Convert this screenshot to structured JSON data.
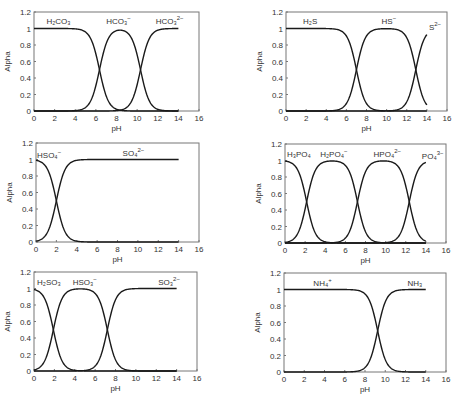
{
  "chart_data": [
    {
      "id": "carbonate",
      "type": "line",
      "title": "",
      "xlabel": "pH",
      "ylabel": "Alpha",
      "xlim": [
        0,
        16
      ],
      "ylim": [
        0,
        1.2
      ],
      "xticks": [
        "0",
        "2",
        "4",
        "6",
        "8",
        "10",
        "12",
        "14",
        "16"
      ],
      "yticks": [
        "0",
        "0.2",
        "0.4",
        "0.6",
        "0.8",
        "1",
        "1.2"
      ],
      "grid": false,
      "pKa": [
        6.35,
        10.33
      ],
      "x_range": [
        0,
        14
      ],
      "series": [
        {
          "name": "H2CO3",
          "label": "H₂CO₃",
          "x": [
            0,
            2,
            4,
            5,
            6,
            6.35,
            7,
            8,
            9,
            10,
            10.33,
            11,
            12,
            14
          ],
          "values": [
            1.0,
            1.0,
            0.996,
            0.957,
            0.69,
            0.5,
            0.183,
            0.022,
            0.002,
            0.0,
            0.0,
            0.0,
            0.0,
            0.0
          ]
        },
        {
          "name": "HCO3-",
          "label": "HCO₃⁻",
          "x": [
            0,
            2,
            4,
            5,
            6,
            6.35,
            7,
            8,
            8.34,
            9,
            10,
            10.33,
            11,
            12,
            14
          ],
          "values": [
            0.0,
            0.0,
            0.004,
            0.043,
            0.309,
            0.5,
            0.816,
            0.956,
            0.98,
            0.954,
            0.68,
            0.5,
            0.176,
            0.021,
            0.0
          ]
        },
        {
          "name": "CO3 2-",
          "label": "CO₃²⁻",
          "x": [
            0,
            6,
            8,
            9,
            10,
            10.33,
            11,
            12,
            13,
            14
          ],
          "values": [
            0.0,
            0.0,
            0.005,
            0.044,
            0.319,
            0.5,
            0.824,
            0.979,
            0.998,
            1.0
          ]
        }
      ]
    },
    {
      "id": "sulfide",
      "type": "line",
      "title": "",
      "xlabel": "pH",
      "ylabel": "Alpha",
      "xlim": [
        0,
        16
      ],
      "ylim": [
        0,
        1.2
      ],
      "xticks": [
        "0",
        "2",
        "4",
        "6",
        "8",
        "10",
        "12",
        "14",
        "16"
      ],
      "yticks": [
        "0",
        "0.2",
        "0.4",
        "0.6",
        "0.8",
        "1",
        "1.2"
      ],
      "grid": false,
      "pKa": [
        7.0,
        12.9
      ],
      "x_range": [
        0,
        14
      ],
      "series": [
        {
          "name": "H2S",
          "label": "H₂S",
          "x": [
            0,
            2,
            4,
            5,
            6,
            7,
            8,
            9,
            10,
            14
          ],
          "values": [
            1.0,
            1.0,
            0.999,
            0.99,
            0.909,
            0.5,
            0.091,
            0.01,
            0.001,
            0.0
          ]
        },
        {
          "name": "HS-",
          "label": "HS⁻",
          "x": [
            0,
            4,
            5,
            6,
            7,
            8,
            9,
            10,
            11,
            12,
            12.9,
            13,
            14
          ],
          "values": [
            0.0,
            0.001,
            0.01,
            0.091,
            0.5,
            0.909,
            0.99,
            0.998,
            0.987,
            0.888,
            0.5,
            0.443,
            0.074
          ]
        },
        {
          "name": "S2-",
          "label": "S²⁻",
          "x": [
            0,
            10,
            11,
            12,
            12.9,
            13,
            14
          ],
          "values": [
            0.0,
            0.001,
            0.012,
            0.112,
            0.5,
            0.557,
            0.926
          ]
        }
      ]
    },
    {
      "id": "sulfate",
      "type": "line",
      "title": "",
      "xlabel": "pH",
      "ylabel": "Alpha",
      "xlim": [
        0,
        16
      ],
      "ylim": [
        0,
        1.2
      ],
      "xticks": [
        "0",
        "2",
        "4",
        "6",
        "8",
        "10",
        "12",
        "14",
        "16"
      ],
      "yticks": [
        "0",
        "0.2",
        "0.4",
        "0.6",
        "0.8",
        "1",
        "1.2"
      ],
      "grid": false,
      "pKa": [
        2.0
      ],
      "x_range": [
        0,
        14
      ],
      "series": [
        {
          "name": "HSO4-",
          "label": "HSO₄⁻",
          "x": [
            0,
            1,
            2,
            3,
            4,
            5,
            14
          ],
          "values": [
            0.99,
            0.909,
            0.5,
            0.091,
            0.01,
            0.001,
            0.0
          ]
        },
        {
          "name": "SO4 2-",
          "label": "SO₄²⁻",
          "x": [
            0,
            1,
            2,
            3,
            4,
            5,
            14
          ],
          "values": [
            0.01,
            0.091,
            0.5,
            0.909,
            0.99,
            0.999,
            1.0
          ]
        }
      ]
    },
    {
      "id": "phosphate",
      "type": "line",
      "title": "",
      "xlabel": "pH",
      "ylabel": "Alpha",
      "xlim": [
        0,
        16
      ],
      "ylim": [
        0,
        1.2
      ],
      "xticks": [
        "0",
        "2",
        "4",
        "6",
        "8",
        "10",
        "12",
        "14",
        "16"
      ],
      "yticks": [
        "0",
        "0.2",
        "0.4",
        "0.6",
        "0.8",
        "1",
        "1.2"
      ],
      "grid": false,
      "pKa": [
        2.15,
        7.2,
        12.35
      ],
      "x_range": [
        0,
        14
      ],
      "series": [
        {
          "name": "H3PO4",
          "label": "H₃PO₄",
          "x": [
            0,
            1,
            2,
            2.15,
            3,
            4,
            5,
            14
          ],
          "values": [
            0.993,
            0.934,
            0.585,
            0.5,
            0.124,
            0.014,
            0.001,
            0.0
          ]
        },
        {
          "name": "H2PO4-",
          "label": "H₂PO₄⁻",
          "x": [
            0,
            1,
            2,
            2.15,
            3,
            4,
            4.7,
            5,
            6,
            7,
            7.2,
            8,
            9,
            10,
            14
          ],
          "values": [
            0.007,
            0.066,
            0.415,
            0.5,
            0.876,
            0.983,
            0.994,
            0.993,
            0.94,
            0.613,
            0.5,
            0.137,
            0.016,
            0.002,
            0.0
          ]
        },
        {
          "name": "HPO4 2-",
          "label": "HPO₄²⁻",
          "x": [
            0,
            5,
            6,
            7,
            7.2,
            8,
            9,
            9.8,
            10,
            11,
            12,
            12.35,
            13,
            14
          ],
          "values": [
            0.0,
            0.006,
            0.059,
            0.387,
            0.5,
            0.863,
            0.984,
            0.995,
            0.993,
            0.957,
            0.691,
            0.5,
            0.183,
            0.022
          ]
        },
        {
          "name": "PO4 3-",
          "label": "PO₄³⁻",
          "x": [
            0,
            9,
            10,
            11,
            12,
            12.35,
            13,
            14
          ],
          "values": [
            0.0,
            0.0,
            0.004,
            0.043,
            0.309,
            0.5,
            0.817,
            0.978
          ]
        }
      ]
    },
    {
      "id": "sulfite",
      "type": "line",
      "title": "",
      "xlabel": "pH",
      "ylabel": "Alpha",
      "xlim": [
        0,
        16
      ],
      "ylim": [
        0,
        1.2
      ],
      "xticks": [
        "0",
        "2",
        "4",
        "6",
        "8",
        "10",
        "12",
        "14",
        "16"
      ],
      "yticks": [
        "0",
        "0.2",
        "0.4",
        "0.6",
        "0.8",
        "1",
        "1.2"
      ],
      "grid": false,
      "pKa": [
        1.9,
        7.2
      ],
      "x_range": [
        0,
        14
      ],
      "series": [
        {
          "name": "H2SO3",
          "label": "H₂SO₃",
          "x": [
            0,
            1,
            1.9,
            3,
            4,
            5,
            14
          ],
          "values": [
            0.988,
            0.888,
            0.5,
            0.074,
            0.008,
            0.001,
            0.0
          ]
        },
        {
          "name": "HSO3-",
          "label": "HSO₃⁻",
          "x": [
            0,
            1,
            1.9,
            3,
            4,
            4.55,
            5,
            6,
            7,
            7.2,
            8,
            9,
            10,
            14
          ],
          "values": [
            0.012,
            0.112,
            0.5,
            0.926,
            0.991,
            0.995,
            0.993,
            0.94,
            0.613,
            0.5,
            0.137,
            0.016,
            0.002,
            0.0
          ]
        },
        {
          "name": "SO3 2-",
          "label": "SO₃²⁻",
          "x": [
            0,
            5,
            6,
            7,
            7.2,
            8,
            9,
            10,
            14
          ],
          "values": [
            0.0,
            0.006,
            0.059,
            0.387,
            0.5,
            0.863,
            0.984,
            0.998,
            1.0
          ]
        }
      ]
    },
    {
      "id": "ammonium",
      "type": "line",
      "title": "",
      "xlabel": "pH",
      "ylabel": "Alpha",
      "xlim": [
        0,
        16
      ],
      "ylim": [
        0,
        1.2
      ],
      "xticks": [
        "0",
        "2",
        "4",
        "6",
        "8",
        "10",
        "12",
        "14",
        "16"
      ],
      "yticks": [
        "0",
        "0.2",
        "0.4",
        "0.6",
        "0.8",
        "1",
        "1.2"
      ],
      "grid": false,
      "pKa": [
        9.25
      ],
      "x_range": [
        0,
        14
      ],
      "series": [
        {
          "name": "NH4+",
          "label": "NH₄⁺",
          "x": [
            0,
            6,
            7,
            8,
            9,
            9.25,
            10,
            11,
            12,
            14
          ],
          "values": [
            1.0,
            0.999,
            0.994,
            0.947,
            0.64,
            0.5,
            0.151,
            0.017,
            0.002,
            0.0
          ]
        },
        {
          "name": "NH3",
          "label": "NH₃",
          "x": [
            0,
            6,
            7,
            8,
            9,
            9.25,
            10,
            11,
            12,
            14
          ],
          "values": [
            0.0,
            0.001,
            0.006,
            0.053,
            0.36,
            0.5,
            0.849,
            0.983,
            0.998,
            1.0
          ]
        }
      ]
    }
  ],
  "layout": [
    {
      "left": 34,
      "top": 12,
      "right": 199,
      "bottom": 111,
      "labels": [
        {
          "main": "H₂CO₃",
          "sup": "",
          "x": 1.2,
          "y": 1.06
        },
        {
          "main": "HCO₃",
          "sup": "−",
          "x": 7.0,
          "y": 1.06
        },
        {
          "main": "HCO₃",
          "sup": "2−",
          "x": 11.8,
          "y": 1.06
        }
      ]
    },
    {
      "left": 286,
      "top": 12,
      "right": 447,
      "bottom": 111,
      "labels": [
        {
          "main": "H₂S",
          "sup": "",
          "x": 1.7,
          "y": 1.06
        },
        {
          "main": "HS",
          "sup": "−",
          "x": 9.5,
          "y": 1.06
        },
        {
          "main": "S",
          "sup": "2−",
          "x": 14.2,
          "y": 0.98
        }
      ]
    },
    {
      "left": 36,
      "top": 143,
      "right": 199,
      "bottom": 242,
      "labels": [
        {
          "main": "HSO₄",
          "sup": "−",
          "x": 0.1,
          "y": 1.02
        },
        {
          "main": "SO₄",
          "sup": "2−",
          "x": 8.5,
          "y": 1.04
        }
      ]
    },
    {
      "left": 285,
      "top": 144,
      "right": 446,
      "bottom": 243,
      "labels": [
        {
          "main": "H₃PO₄",
          "sup": "",
          "x": 0.2,
          "y": 1.04
        },
        {
          "main": "H₂PO₄",
          "sup": "−",
          "x": 3.5,
          "y": 1.04
        },
        {
          "main": "HPO₄",
          "sup": "2−",
          "x": 8.8,
          "y": 1.04
        },
        {
          "main": "PO₄",
          "sup": "3−",
          "x": 13.6,
          "y": 1.02
        }
      ]
    },
    {
      "left": 34,
      "top": 272,
      "right": 197,
      "bottom": 371,
      "labels": [
        {
          "main": "H₂SO₃",
          "sup": "",
          "x": 0.3,
          "y": 1.04
        },
        {
          "main": "HSO₃",
          "sup": "−",
          "x": 3.8,
          "y": 1.04
        },
        {
          "main": "SO₃",
          "sup": "2−",
          "x": 12.2,
          "y": 1.04
        }
      ]
    },
    {
      "left": 284,
      "top": 273,
      "right": 446,
      "bottom": 372,
      "labels": [
        {
          "main": "NH₄",
          "sup": "+",
          "x": 2.9,
          "y": 1.04
        },
        {
          "main": "NH₃",
          "sup": "",
          "x": 12.2,
          "y": 1.04
        }
      ]
    }
  ],
  "style": {
    "line_color": "#1a1a1a",
    "axis_color": "#777777",
    "text_color": "#333333"
  }
}
